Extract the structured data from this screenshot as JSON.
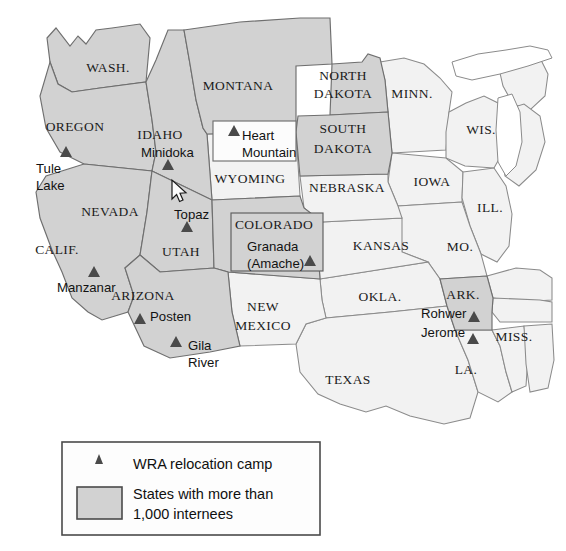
{
  "figure": {
    "kind": "thematic-map",
    "region": "Western and Central United States",
    "background_color": "#ffffff",
    "shaded_fill": "#d2d2d2",
    "plain_fill": "#f2f2f2",
    "outline_color": "#6f6f6f",
    "marker_color": "#4a4a4a"
  },
  "state_labels": [
    {
      "id": "wash",
      "text": "WASH.",
      "x": 108,
      "y": 72,
      "style": "serif"
    },
    {
      "id": "oregon",
      "text": "OREGON",
      "x": 75,
      "y": 131,
      "style": "serif"
    },
    {
      "id": "idaho",
      "text": "IDAHO",
      "x": 160,
      "y": 139,
      "style": "serif"
    },
    {
      "id": "montana",
      "text": "MONTANA",
      "x": 238,
      "y": 90,
      "style": "serif"
    },
    {
      "id": "north-dakota-1",
      "text": "NORTH",
      "x": 343,
      "y": 80,
      "style": "serif"
    },
    {
      "id": "north-dakota-2",
      "text": "DAKOTA",
      "x": 343,
      "y": 98,
      "style": "serif"
    },
    {
      "id": "minn",
      "text": "MINN.",
      "x": 412,
      "y": 98,
      "style": "serif"
    },
    {
      "id": "wis",
      "text": "WIS.",
      "x": 481,
      "y": 134,
      "style": "serif"
    },
    {
      "id": "south-dakota-1",
      "text": "SOUTH",
      "x": 343,
      "y": 133,
      "style": "serif"
    },
    {
      "id": "south-dakota-2",
      "text": "DAKOTA",
      "x": 343,
      "y": 153,
      "style": "serif"
    },
    {
      "id": "wyoming",
      "text": "WYOMING",
      "x": 250,
      "y": 183,
      "style": "serif"
    },
    {
      "id": "nebraska",
      "text": "NEBRASKA",
      "x": 347,
      "y": 192,
      "style": "serif"
    },
    {
      "id": "iowa",
      "text": "IOWA",
      "x": 432,
      "y": 186,
      "style": "serif"
    },
    {
      "id": "ill",
      "text": "ILL.",
      "x": 490,
      "y": 212,
      "style": "serif"
    },
    {
      "id": "nevada",
      "text": "NEVADA",
      "x": 110,
      "y": 216,
      "style": "serif"
    },
    {
      "id": "colorado",
      "text": "COLORADO",
      "x": 274,
      "y": 229,
      "style": "serif"
    },
    {
      "id": "kansas",
      "text": "KANSAS",
      "x": 381,
      "y": 250,
      "style": "serif"
    },
    {
      "id": "mo",
      "text": "MO.",
      "x": 460,
      "y": 251,
      "style": "serif"
    },
    {
      "id": "calif",
      "text": "CALIF.",
      "x": 57,
      "y": 254,
      "style": "serif"
    },
    {
      "id": "utah",
      "text": "UTAH",
      "x": 181,
      "y": 256,
      "style": "serif"
    },
    {
      "id": "ark",
      "text": "ARK.",
      "x": 463,
      "y": 299,
      "style": "serif"
    },
    {
      "id": "arizona",
      "text": "ARIZONA",
      "x": 143,
      "y": 300,
      "style": "serif"
    },
    {
      "id": "okla",
      "text": "OKLA.",
      "x": 380,
      "y": 301,
      "style": "serif"
    },
    {
      "id": "new-mexico-1",
      "text": "NEW",
      "x": 263,
      "y": 311,
      "style": "serif"
    },
    {
      "id": "new-mexico-2",
      "text": "MEXICO",
      "x": 263,
      "y": 330,
      "style": "serif"
    },
    {
      "id": "miss",
      "text": "MISS.",
      "x": 514,
      "y": 341,
      "style": "serif"
    },
    {
      "id": "la",
      "text": "LA.",
      "x": 466,
      "y": 374,
      "style": "serif"
    },
    {
      "id": "texas",
      "text": "TEXAS",
      "x": 348,
      "y": 384,
      "style": "serif"
    }
  ],
  "camps": [
    {
      "id": "tule-lake",
      "name_lines": [
        "Tule",
        "Lake"
      ],
      "label_x": 36,
      "label_y": 173,
      "label_anchor": "start",
      "marker_x": 66,
      "marker_y": 157
    },
    {
      "id": "minidoka",
      "name_lines": [
        "Minidoka"
      ],
      "label_x": 141,
      "label_y": 157,
      "label_anchor": "start",
      "marker_x": 168,
      "marker_y": 170
    },
    {
      "id": "heart-mountain",
      "name_lines": [
        "Heart",
        "Mountain"
      ],
      "label_x": 242,
      "label_y": 140,
      "label_anchor": "start",
      "marker_x": 234,
      "marker_y": 136
    },
    {
      "id": "topaz",
      "name_lines": [
        "Topaz"
      ],
      "label_x": 174,
      "label_y": 219,
      "label_anchor": "start",
      "marker_x": 187,
      "marker_y": 232
    },
    {
      "id": "granada-amache",
      "name_lines": [
        "Granada",
        "(Amache)"
      ],
      "label_x": 247,
      "label_y": 251,
      "label_anchor": "start",
      "marker_x": 310,
      "marker_y": 266
    },
    {
      "id": "manzanar",
      "name_lines": [
        "Manzanar"
      ],
      "label_x": 57,
      "label_y": 292,
      "label_anchor": "start",
      "marker_x": 94,
      "marker_y": 277
    },
    {
      "id": "posten",
      "name_lines": [
        "Posten"
      ],
      "label_x": 150,
      "label_y": 321,
      "label_anchor": "start",
      "marker_x": 140,
      "marker_y": 324
    },
    {
      "id": "gila-river",
      "name_lines": [
        "Gila",
        "River"
      ],
      "label_x": 188,
      "label_y": 350,
      "label_anchor": "start",
      "marker_x": 176,
      "marker_y": 347
    },
    {
      "id": "rohwer",
      "name_lines": [
        "Rohwer"
      ],
      "label_x": 421,
      "label_y": 318,
      "label_anchor": "start",
      "marker_x": 474,
      "marker_y": 322
    },
    {
      "id": "jerome",
      "name_lines": [
        "Jerome"
      ],
      "label_x": 421,
      "label_y": 337,
      "label_anchor": "start",
      "marker_x": 473,
      "marker_y": 344
    }
  ],
  "callouts": [
    {
      "id": "heart-mountain-callout",
      "fill": "white"
    },
    {
      "id": "granada-callout",
      "fill": "grey"
    }
  ],
  "legend": {
    "items": [
      {
        "id": "wra-camp",
        "symbol": "triangle-marker",
        "label": "WRA relocation camp"
      },
      {
        "id": "shaded-states",
        "symbol": "grey-swatch",
        "label_lines": [
          "States with more than",
          "1,000 internees"
        ]
      }
    ]
  },
  "cursor": {
    "type": "arrow-pointer",
    "x": 172,
    "y": 180
  }
}
